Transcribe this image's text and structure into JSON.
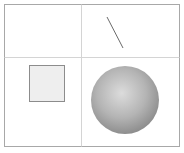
{
  "diagram": {
    "layout": "2x2 grid",
    "colors": {
      "border": "#a8a8a8",
      "divider": "#d4d4d4",
      "line": "#6a6a6a",
      "square_fill": "#eeeeee",
      "square_stroke": "#8c8c8c",
      "sphere_light": "#dcdcdc",
      "sphere_dark": "#8e8e8e"
    },
    "cells": [
      {
        "position": "top-left",
        "content": "empty"
      },
      {
        "position": "top-right",
        "content": "diagonal-line"
      },
      {
        "position": "bottom-left",
        "content": "square"
      },
      {
        "position": "bottom-right",
        "content": "sphere"
      }
    ]
  }
}
